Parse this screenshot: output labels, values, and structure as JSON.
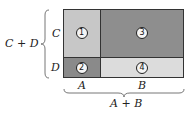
{
  "diagram": {
    "type": "area-model-rectangle",
    "cells": [
      {
        "id": "1",
        "label": "1",
        "row": "C",
        "col": "A",
        "color": "#c7c7c7"
      },
      {
        "id": "3",
        "label": "3",
        "row": "C",
        "col": "B",
        "color": "#8e8e8e"
      },
      {
        "id": "2",
        "label": "2",
        "row": "D",
        "col": "A",
        "color": "#8a8a8a"
      },
      {
        "id": "4",
        "label": "4",
        "row": "D",
        "col": "B",
        "color": "#dcdcdc"
      }
    ],
    "row_labels": {
      "c": "C",
      "d": "D"
    },
    "col_labels": {
      "a": "A",
      "b": "B"
    },
    "left_brace_label": "C + D",
    "bottom_brace_label": "A + B"
  }
}
